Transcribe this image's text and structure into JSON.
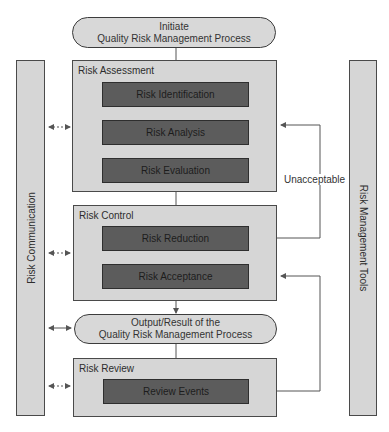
{
  "diagram": {
    "start": {
      "line1": "Initiate",
      "line2": "Quality Risk Management Process"
    },
    "output": {
      "line1": "Output/Result of the",
      "line2": "Quality Risk Management Process"
    },
    "stages": [
      {
        "label": "Risk Assessment",
        "steps": [
          "Risk Identification",
          "Risk Analysis",
          "Risk Evaluation"
        ]
      },
      {
        "label": "Risk Control",
        "steps": [
          "Risk Reduction",
          "Risk Acceptance"
        ]
      },
      {
        "label": "Risk Review",
        "steps": [
          "Review Events"
        ]
      }
    ],
    "left_column": "Risk Communication",
    "right_column": "Risk Management Tools",
    "feedback_label": "Unacceptable"
  },
  "colors": {
    "outer_fill": "#d6d6d6",
    "inner_fill": "#5c5c5c",
    "line": "#555555"
  }
}
